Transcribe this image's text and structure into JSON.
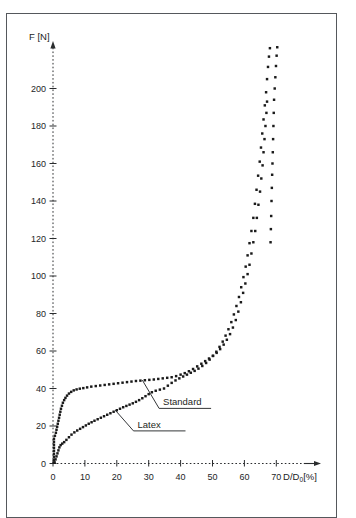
{
  "figure": {
    "background_color": "#ffffff",
    "frame_color": "#55585c",
    "marker_color": "#1a1a1a",
    "axis_color": "#2a2c2e"
  },
  "chart_data": {
    "type": "scatter",
    "title": "",
    "subtitle": "",
    "xlabel": "D/D0[%]",
    "xlabel_parts": {
      "pre": "D/D",
      "sub": "0",
      "post": "[%]"
    },
    "ylabel": "F [N]",
    "xlim": [
      0,
      78
    ],
    "ylim": [
      0,
      225
    ],
    "xticks": [
      0,
      10,
      20,
      30,
      40,
      50,
      60,
      70
    ],
    "xtick_labels": [
      "0",
      "10",
      "20",
      "30",
      "40",
      "50",
      "60",
      "70"
    ],
    "yticks": [
      0,
      20,
      40,
      60,
      80,
      100,
      120,
      140,
      160,
      180,
      200
    ],
    "ytick_labels": [
      "0",
      "20",
      "40",
      "60",
      "80",
      "100",
      "120",
      "140",
      "160",
      "180",
      "200"
    ],
    "grid": false,
    "x_axis_style": "dashed-with-arrow",
    "y_axis_style": "dashed-with-arrow",
    "legend_position": "inline-annotations",
    "annotations": [
      {
        "text": "Standard",
        "x_text": 34.5,
        "y_text": 31.0,
        "x_point": 28.0,
        "y_point": 44.5
      },
      {
        "text": "Latex",
        "x_text": 26.5,
        "y_text": 19.0,
        "x_point": 19.5,
        "y_point": 28.5
      }
    ],
    "series": [
      {
        "name": "Latex",
        "marker": "square",
        "points": [
          [
            0.3,
            0.5
          ],
          [
            0.3,
            2.0
          ],
          [
            0.3,
            3.6
          ],
          [
            0.3,
            5.2
          ],
          [
            0.3,
            6.8
          ],
          [
            0.3,
            8.4
          ],
          [
            0.3,
            10.0
          ],
          [
            0.3,
            11.6
          ],
          [
            0.3,
            13.2
          ],
          [
            0.6,
            14.8
          ],
          [
            0.9,
            16.4
          ],
          [
            1.1,
            18.0
          ],
          [
            1.3,
            19.6
          ],
          [
            1.5,
            21.2
          ],
          [
            1.7,
            22.8
          ],
          [
            1.9,
            24.4
          ],
          [
            2.1,
            26.0
          ],
          [
            2.3,
            27.6
          ],
          [
            2.5,
            29.2
          ],
          [
            2.8,
            30.8
          ],
          [
            3.1,
            32.4
          ],
          [
            3.5,
            33.8
          ],
          [
            3.9,
            35.0
          ],
          [
            4.4,
            36.2
          ],
          [
            5.0,
            37.3
          ],
          [
            5.7,
            38.2
          ],
          [
            6.5,
            39.0
          ],
          [
            7.4,
            39.5
          ],
          [
            8.4,
            39.9
          ],
          [
            9.5,
            40.2
          ],
          [
            10.7,
            40.6
          ],
          [
            12.0,
            41.0
          ],
          [
            13.4,
            41.3
          ],
          [
            14.8,
            41.6
          ],
          [
            16.2,
            41.9
          ],
          [
            17.6,
            42.2
          ],
          [
            19.0,
            42.5
          ],
          [
            20.4,
            42.8
          ],
          [
            21.8,
            43.1
          ],
          [
            23.2,
            43.4
          ],
          [
            24.6,
            43.7
          ],
          [
            26.0,
            44.0
          ],
          [
            27.4,
            44.2
          ],
          [
            28.8,
            44.4
          ],
          [
            30.2,
            44.6
          ],
          [
            31.6,
            44.8
          ],
          [
            33.0,
            45.1
          ],
          [
            34.4,
            45.4
          ],
          [
            35.8,
            45.7
          ],
          [
            37.2,
            46.0
          ],
          [
            38.6,
            46.6
          ],
          [
            40.0,
            47.4
          ],
          [
            41.3,
            48.2
          ],
          [
            42.6,
            49.2
          ],
          [
            43.9,
            50.4
          ],
          [
            45.2,
            51.8
          ],
          [
            46.5,
            53.2
          ],
          [
            47.7,
            54.6
          ],
          [
            48.9,
            56.0
          ],
          [
            50.1,
            57.4
          ],
          [
            51.3,
            59.0
          ],
          [
            52.4,
            61.0
          ],
          [
            53.5,
            63.4
          ],
          [
            54.5,
            66.0
          ],
          [
            55.5,
            69.0
          ],
          [
            56.4,
            72.5
          ],
          [
            57.3,
            76.5
          ],
          [
            58.1,
            81.0
          ],
          [
            58.9,
            86.0
          ],
          [
            59.6,
            91.0
          ],
          [
            60.3,
            96.0
          ],
          [
            61.0,
            101.0
          ],
          [
            61.6,
            106.0
          ],
          [
            62.2,
            112.0
          ],
          [
            62.8,
            118.0
          ],
          [
            63.4,
            124.0
          ],
          [
            63.9,
            131.0
          ],
          [
            64.4,
            138.0
          ],
          [
            64.9,
            145.0
          ],
          [
            65.3,
            152.0
          ],
          [
            65.7,
            159.0
          ],
          [
            66.0,
            166.0
          ],
          [
            66.3,
            173.0
          ],
          [
            66.6,
            180.0
          ],
          [
            66.9,
            187.0
          ],
          [
            67.1,
            193.0
          ]
        ]
      },
      {
        "name": "Standard",
        "marker": "square",
        "points": [
          [
            0.5,
            0.6
          ],
          [
            0.8,
            2.2
          ],
          [
            1.1,
            3.8
          ],
          [
            1.4,
            5.4
          ],
          [
            1.7,
            7.0
          ],
          [
            2.0,
            8.6
          ],
          [
            2.4,
            9.8
          ],
          [
            2.9,
            10.6
          ],
          [
            3.5,
            11.4
          ],
          [
            4.2,
            12.6
          ],
          [
            5.0,
            14.0
          ],
          [
            5.8,
            15.4
          ],
          [
            6.7,
            16.6
          ],
          [
            7.6,
            17.6
          ],
          [
            8.5,
            18.5
          ],
          [
            9.4,
            19.4
          ],
          [
            10.3,
            20.3
          ],
          [
            11.2,
            21.2
          ],
          [
            12.1,
            22.0
          ],
          [
            13.0,
            22.8
          ],
          [
            14.0,
            23.6
          ],
          [
            15.0,
            24.4
          ],
          [
            16.0,
            25.2
          ],
          [
            17.0,
            26.0
          ],
          [
            18.0,
            26.8
          ],
          [
            19.0,
            27.6
          ],
          [
            20.0,
            28.4
          ],
          [
            21.0,
            29.2
          ],
          [
            22.0,
            30.0
          ],
          [
            23.0,
            30.7
          ],
          [
            24.0,
            31.4
          ],
          [
            25.0,
            32.1
          ],
          [
            26.0,
            32.9
          ],
          [
            27.0,
            33.8
          ],
          [
            28.0,
            34.8
          ],
          [
            29.0,
            35.9
          ],
          [
            30.0,
            37.0
          ],
          [
            31.0,
            38.0
          ],
          [
            32.2,
            38.8
          ],
          [
            33.5,
            39.4
          ],
          [
            34.8,
            40.0
          ],
          [
            36.0,
            41.5
          ],
          [
            37.2,
            43.0
          ],
          [
            38.4,
            44.3
          ],
          [
            39.6,
            45.4
          ],
          [
            40.8,
            46.4
          ],
          [
            42.0,
            47.4
          ],
          [
            43.2,
            48.4
          ],
          [
            44.4,
            49.4
          ],
          [
            45.6,
            50.6
          ],
          [
            46.8,
            52.0
          ],
          [
            48.0,
            53.6
          ],
          [
            49.1,
            55.4
          ],
          [
            50.2,
            57.4
          ],
          [
            51.2,
            59.6
          ],
          [
            52.2,
            62.2
          ],
          [
            53.2,
            65.0
          ],
          [
            54.1,
            68.2
          ],
          [
            55.0,
            71.6
          ],
          [
            55.9,
            75.4
          ],
          [
            56.7,
            79.5
          ],
          [
            57.5,
            84.0
          ],
          [
            58.3,
            88.8
          ],
          [
            59.0,
            94.0
          ],
          [
            59.7,
            99.4
          ],
          [
            60.4,
            105.0
          ],
          [
            61.0,
            111.0
          ],
          [
            61.6,
            117.5
          ],
          [
            62.2,
            124.0
          ],
          [
            62.8,
            131.0
          ],
          [
            63.3,
            138.5
          ],
          [
            63.8,
            146.0
          ],
          [
            64.3,
            153.5
          ],
          [
            64.8,
            161.0
          ],
          [
            65.2,
            168.5
          ],
          [
            65.6,
            176.0
          ],
          [
            66.0,
            183.5
          ],
          [
            66.4,
            191.0
          ],
          [
            66.8,
            198.0
          ],
          [
            67.1,
            205.0
          ],
          [
            67.4,
            211.5
          ],
          [
            67.7,
            217.0
          ],
          [
            68.0,
            221.5
          ],
          [
            69.3,
            194.0
          ],
          [
            69.5,
            200.0
          ],
          [
            69.7,
            206.0
          ],
          [
            69.9,
            212.0
          ],
          [
            70.1,
            217.5
          ],
          [
            70.3,
            222.0
          ],
          [
            68.9,
            166.0
          ],
          [
            69.0,
            173.0
          ],
          [
            69.1,
            180.0
          ],
          [
            69.2,
            187.0
          ],
          [
            68.5,
            140.0
          ],
          [
            68.6,
            147.0
          ],
          [
            68.7,
            154.0
          ],
          [
            68.8,
            160.0
          ],
          [
            68.2,
            118.0
          ],
          [
            68.3,
            125.0
          ],
          [
            68.4,
            132.0
          ]
        ]
      }
    ]
  }
}
